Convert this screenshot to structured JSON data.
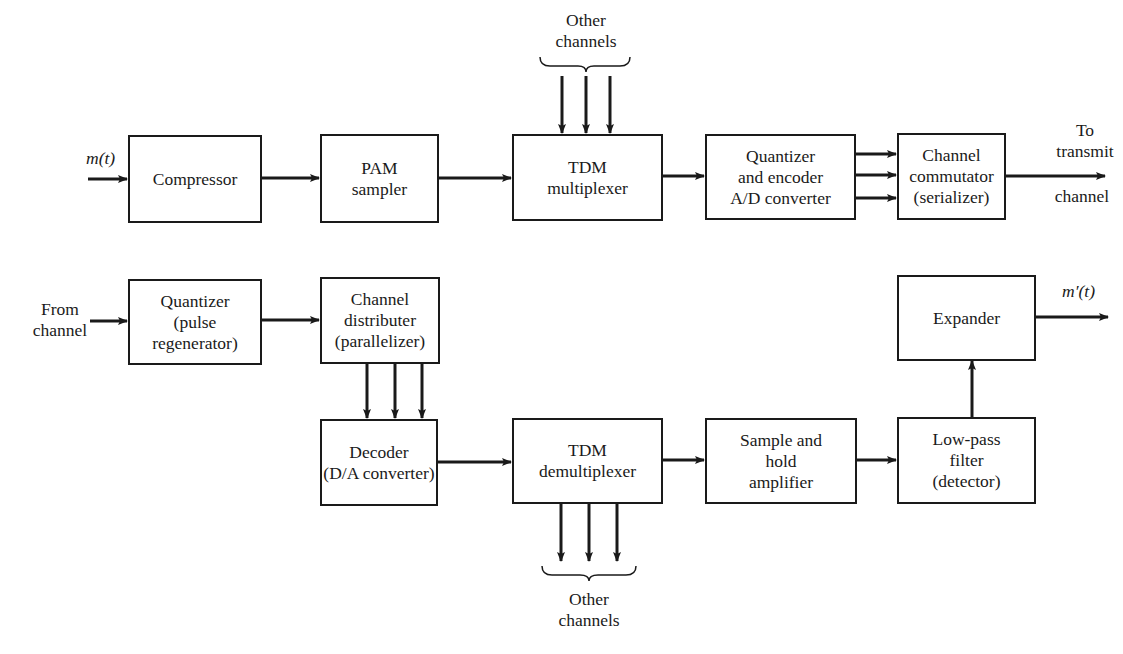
{
  "diagram": {
    "transmitter": {
      "input_label": "m(t)",
      "blocks": [
        {
          "id": "compressor",
          "lines": [
            "Compressor"
          ]
        },
        {
          "id": "pam-sampler",
          "lines": [
            "PAM",
            "sampler"
          ]
        },
        {
          "id": "tdm-multiplexer",
          "lines": [
            "TDM",
            "multiplexer"
          ]
        },
        {
          "id": "quantizer-encoder",
          "lines": [
            "Quantizer",
            "and encoder",
            "A/D converter"
          ]
        },
        {
          "id": "channel-commutator",
          "lines": [
            "Channel",
            "commutator",
            "(serializer)"
          ]
        }
      ],
      "other_channels_label": [
        "Other",
        "channels"
      ],
      "output_label": [
        "To",
        "transmit",
        "channel"
      ]
    },
    "receiver": {
      "input_label": [
        "From",
        "channel"
      ],
      "blocks": [
        {
          "id": "quantizer-regenerator",
          "lines": [
            "Quantizer",
            "(pulse",
            "regenerator)"
          ]
        },
        {
          "id": "channel-distributer",
          "lines": [
            "Channel",
            "distributer",
            "(parallelizer)"
          ]
        },
        {
          "id": "decoder",
          "lines": [
            "Decoder",
            "(D/A converter)"
          ]
        },
        {
          "id": "tdm-demultiplexer",
          "lines": [
            "TDM",
            "demultiplexer"
          ]
        },
        {
          "id": "sample-hold",
          "lines": [
            "Sample and",
            "hold",
            "amplifier"
          ]
        },
        {
          "id": "low-pass-filter",
          "lines": [
            "Low-pass",
            "filter",
            "(detector)"
          ]
        },
        {
          "id": "expander",
          "lines": [
            "Expander"
          ]
        }
      ],
      "other_channels_label": [
        "Other",
        "channels"
      ],
      "output_label": "m′(t)"
    }
  }
}
